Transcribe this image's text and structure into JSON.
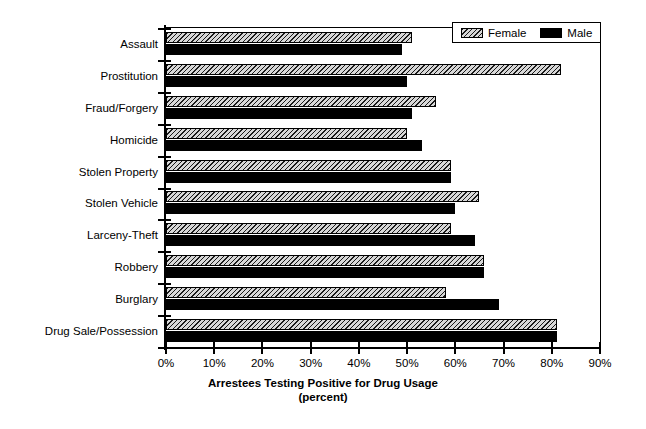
{
  "chart_data": {
    "type": "bar",
    "orientation": "horizontal",
    "title": "",
    "xlabel": "Arrestees Testing Positive for Drug Usage",
    "xlabel_sub": "(percent)",
    "ylabel": "",
    "xlim": [
      0,
      90
    ],
    "xtick_labels": [
      "0%",
      "10%",
      "20%",
      "30%",
      "40%",
      "50%",
      "60%",
      "70%",
      "80%",
      "90%"
    ],
    "xtick_values": [
      0,
      10,
      20,
      30,
      40,
      50,
      60,
      70,
      80,
      90
    ],
    "grid": false,
    "legend_position": "top-right",
    "categories": [
      "Assault",
      "Prostitution",
      "Fraud/Forgery",
      "Homicide",
      "Stolen Property",
      "Stolen Vehicle",
      "Larceny-Theft",
      "Robbery",
      "Burglary",
      "Drug Sale/Possession"
    ],
    "series": [
      {
        "name": "Female",
        "pattern": "hatched",
        "color": "#d8d8d8",
        "values": [
          51,
          82,
          56,
          50,
          59,
          65,
          59,
          66,
          58,
          81
        ]
      },
      {
        "name": "Male",
        "pattern": "solid",
        "color": "#000000",
        "values": [
          49,
          50,
          51,
          53,
          59,
          60,
          64,
          66,
          69,
          81
        ]
      }
    ]
  },
  "legend": {
    "items": [
      {
        "label": "Female",
        "swatch": "hatched-swatch"
      },
      {
        "label": "Male",
        "swatch": "solid-black-swatch"
      }
    ]
  }
}
